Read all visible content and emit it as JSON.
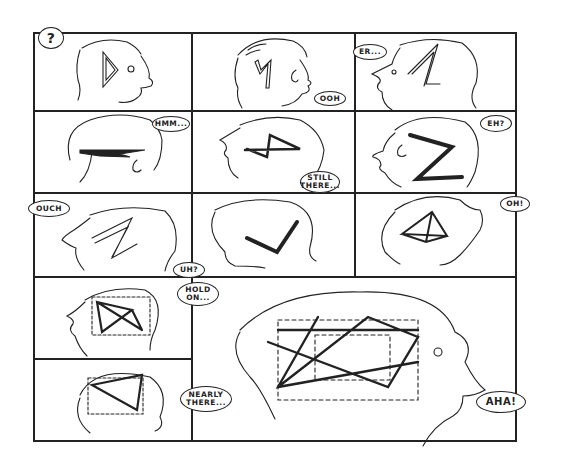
{
  "comic": {
    "panels": [
      {
        "id": 1,
        "bubble": "?",
        "shape": "triangle"
      },
      {
        "id": 2,
        "bubble": "OOH",
        "shape": "zigzag"
      },
      {
        "id": 3,
        "bubble": "ER...",
        "shape": "zigzag"
      },
      {
        "id": 4,
        "bubble": "HMM...",
        "shape": "flat-zigzag"
      },
      {
        "id": 5,
        "bubble": "STILL\nTHERE...",
        "shape": "zigzag"
      },
      {
        "id": 6,
        "bubble": "EH?",
        "shape": "zigzag"
      },
      {
        "id": 7,
        "bubble": "OUCH",
        "shape": "zigzag"
      },
      {
        "id": 8,
        "bubble": "UH?",
        "shape": "zigzag"
      },
      {
        "id": 9,
        "bubble": "OH!",
        "shape": "tetrahedron"
      },
      {
        "id": 10,
        "bubble": "HOLD\nON...",
        "shape": "partial-cube"
      },
      {
        "id": 11,
        "bubble": "NEARLY\nTHERE...",
        "shape": "partial-cube"
      },
      {
        "id": 12,
        "bubble": "AHA!",
        "shape": "cube-with-star"
      }
    ],
    "colors": {
      "ink": "#222222",
      "paper": "#ffffff"
    }
  }
}
